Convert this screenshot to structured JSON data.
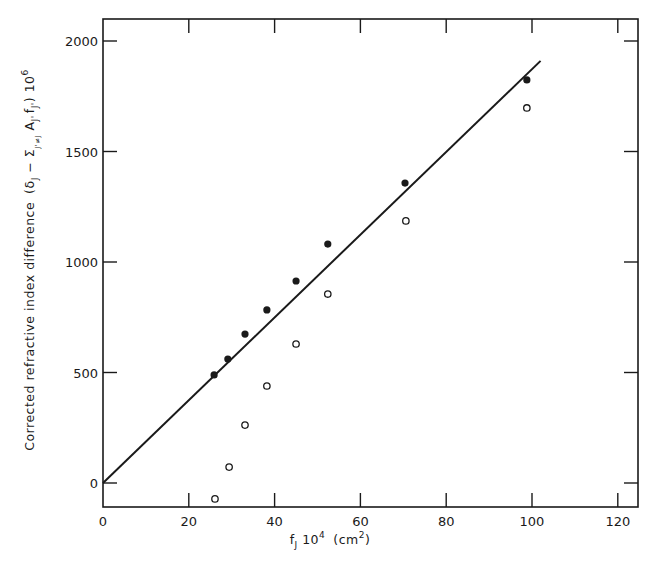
{
  "chart_data": {
    "type": "scatter",
    "title": "",
    "xlabel": "f_J 10^4 (cm^2)",
    "ylabel": "Corrected refractive index difference (δ_J − Σ_{J'≠J} A_{J'} f_{J'}) 10^6",
    "xlim": [
      0,
      125
    ],
    "ylim": [
      -110,
      2100
    ],
    "x_ticks": [
      0,
      20,
      40,
      60,
      80,
      100,
      120
    ],
    "y_ticks": [
      0,
      500,
      1000,
      1500,
      2000
    ],
    "grid": false,
    "legend": null,
    "series": [
      {
        "name": "corrected (filled circles)",
        "marker": "filled-circle",
        "x": [
          25.9,
          29.1,
          33.1,
          38.2,
          45.0,
          52.4,
          70.4,
          98.8
        ],
        "y": [
          489,
          561,
          674,
          783,
          914,
          1081,
          1357,
          1824
        ]
      },
      {
        "name": "uncorrected (open circles)",
        "marker": "open-circle",
        "x": [
          26.1,
          29.4,
          33.1,
          38.2,
          45.0,
          52.4,
          70.6,
          98.8
        ],
        "y": [
          -72,
          72,
          262,
          439,
          629,
          855,
          1186,
          1697
        ]
      },
      {
        "name": "fitted line",
        "type": "line",
        "x": [
          0,
          102
        ],
        "y": [
          0,
          1910
        ]
      }
    ]
  },
  "labels": {
    "x_axis": "f",
    "x_axis_sub": "J",
    "x_axis_rest": " 10",
    "x_axis_exp": "4",
    "x_axis_unit": "(cm",
    "x_axis_unit_exp": "2",
    "x_axis_unit_close": ")",
    "y_axis_main": "Corrected refractive index difference",
    "y_axis_expr": "(δ",
    "y_axis_expr_sub": "J",
    "y_axis_expr_mid": " − Σ",
    "y_axis_expr_sum_sub": "J'≠J",
    "y_axis_expr_A": " A",
    "y_axis_expr_A_sub": "J'",
    "y_axis_expr_f": "f",
    "y_axis_expr_f_sub": "J'",
    "y_axis_expr_close": ") 10",
    "y_axis_expr_exp": "6"
  }
}
